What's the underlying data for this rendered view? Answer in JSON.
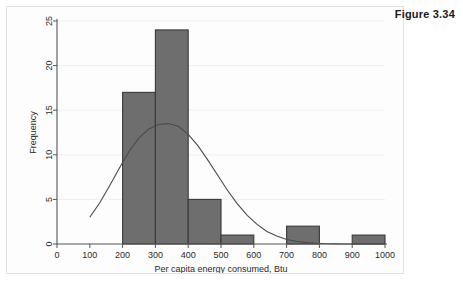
{
  "figure": {
    "caption": "Figure 3.34"
  },
  "chart_data": {
    "type": "bar",
    "title": "",
    "subtitle": "",
    "xlabel": "Per capita energy consumed, Btu",
    "ylabel": "Frequency",
    "xlim": [
      0,
      1000
    ],
    "ylim": [
      0,
      25
    ],
    "xticks": [
      0,
      100,
      200,
      300,
      400,
      500,
      600,
      700,
      800,
      900,
      1000
    ],
    "yticks": [
      0,
      5,
      10,
      15,
      20,
      25
    ],
    "grid": "horizontal",
    "legend": "none",
    "bin_width": 100,
    "categories": [
      "100-200",
      "200-300",
      "300-400",
      "400-500",
      "500-600",
      "600-700",
      "700-800",
      "800-900",
      "900-1000"
    ],
    "bin_starts": [
      100,
      200,
      300,
      400,
      500,
      600,
      700,
      800,
      900
    ],
    "values": [
      0,
      17,
      24,
      5,
      1,
      0,
      2,
      0,
      1
    ],
    "bars": [
      {
        "start": 200,
        "end": 300,
        "frequency": 17
      },
      {
        "start": 300,
        "end": 400,
        "frequency": 24
      },
      {
        "start": 400,
        "end": 500,
        "frequency": 5
      },
      {
        "start": 500,
        "end": 600,
        "frequency": 1
      },
      {
        "start": 700,
        "end": 800,
        "frequency": 2
      },
      {
        "start": 900,
        "end": 1000,
        "frequency": 1
      }
    ],
    "overlay": {
      "type": "line",
      "name": "normal density curve",
      "peak_x": 350,
      "peak_y": 13.5,
      "x_start": 100,
      "x_end": 1000,
      "points": [
        [
          100,
          3.0
        ],
        [
          130,
          4.6
        ],
        [
          160,
          6.5
        ],
        [
          190,
          8.5
        ],
        [
          220,
          10.4
        ],
        [
          250,
          11.9
        ],
        [
          280,
          12.9
        ],
        [
          310,
          13.4
        ],
        [
          340,
          13.5
        ],
        [
          370,
          13.2
        ],
        [
          400,
          12.3
        ],
        [
          430,
          11.0
        ],
        [
          460,
          9.4
        ],
        [
          490,
          7.7
        ],
        [
          520,
          6.0
        ],
        [
          550,
          4.5
        ],
        [
          580,
          3.2
        ],
        [
          610,
          2.2
        ],
        [
          640,
          1.4
        ],
        [
          670,
          0.9
        ],
        [
          700,
          0.5
        ],
        [
          730,
          0.3
        ],
        [
          760,
          0.15
        ],
        [
          790,
          0.07
        ],
        [
          820,
          0.03
        ],
        [
          850,
          0.01
        ],
        [
          880,
          0.0
        ],
        [
          910,
          0.0
        ],
        [
          940,
          0.0
        ],
        [
          970,
          0.0
        ],
        [
          1000,
          0.0
        ]
      ]
    },
    "colors": {
      "bar_fill": "#6e6e6e",
      "bar_stroke": "#3a3a3a",
      "curve": "#4a4a4a",
      "axis": "#555555",
      "grid": "#efefef",
      "text": "#2a2a2a",
      "background": "#fdfdfd"
    }
  }
}
